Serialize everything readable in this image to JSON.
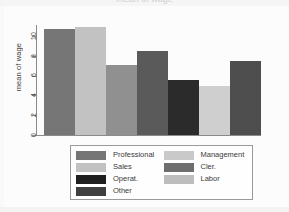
{
  "title": "mean of wage",
  "chart_data": {
    "type": "bar",
    "title": "",
    "xlabel": "",
    "ylabel": "mean of wage",
    "categories": [
      "Professional",
      "Sales",
      "Operat.",
      "Other",
      "Cler.",
      "Labor",
      "Management"
    ],
    "values": [
      10.7,
      10.9,
      7.1,
      8.5,
      5.6,
      4.9,
      7.5
    ],
    "colors": [
      "#767676",
      "#c2c2c2",
      "#909090",
      "#5a5a5a",
      "#2b2b2b",
      "#cfcfcf",
      "#4e4e4e"
    ],
    "ylim": [
      0,
      11.4
    ],
    "yticks": [
      0,
      2,
      4,
      6,
      8,
      10
    ],
    "ytick_labels": [
      "0",
      "2",
      "4",
      "6",
      "8",
      "10"
    ],
    "grid": false,
    "legend_position": "bottom"
  },
  "axis": {
    "y_label": "mean of wage",
    "ticks": [
      {
        "value": 10,
        "label": "10"
      },
      {
        "value": 8,
        "label": "8"
      },
      {
        "value": 6,
        "label": "6"
      },
      {
        "value": 4,
        "label": "4"
      },
      {
        "value": 2,
        "label": "2"
      },
      {
        "value": 0,
        "label": "0"
      }
    ]
  },
  "bars": [
    {
      "label": "Professional",
      "value": 10.7,
      "color": "#767676"
    },
    {
      "label": "Sales",
      "value": 10.9,
      "color": "#c2c2c2"
    },
    {
      "label": "Operat.",
      "value": 7.1,
      "color": "#909090"
    },
    {
      "label": "Other",
      "value": 8.5,
      "color": "#5a5a5a"
    },
    {
      "label": "Cler.",
      "value": 5.6,
      "color": "#2b2b2b"
    },
    {
      "label": "Labor",
      "value": 4.9,
      "color": "#cfcfcf"
    },
    {
      "label": "Management",
      "value": 7.5,
      "color": "#4e4e4e"
    }
  ],
  "legend": {
    "left_column": [
      {
        "label": "Professional",
        "color": "#767676"
      },
      {
        "label": "Sales",
        "color": "#c2c2c2"
      },
      {
        "label": "Operat.",
        "color": "#1f1f1f"
      },
      {
        "label": "Other",
        "color": "#3f3f3f"
      }
    ],
    "right_column": [
      {
        "label": "Management",
        "color": "#c9c9c9"
      },
      {
        "label": "Cler.",
        "color": "#6e6e6e"
      },
      {
        "label": "Labor",
        "color": "#bdbdbd"
      }
    ]
  }
}
